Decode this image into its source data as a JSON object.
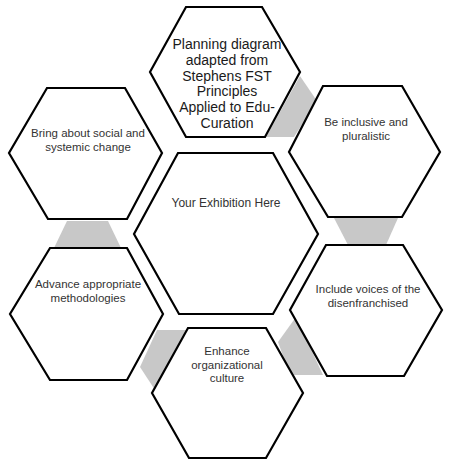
{
  "diagram": {
    "type": "hexagon-cycle",
    "colors": {
      "stroke": "#000000",
      "fill": "#ffffff",
      "connector": "#c8c8c8",
      "text": "#333333"
    },
    "center": {
      "label": "Your Exhibition Here"
    },
    "nodes": [
      {
        "id": "top",
        "label": "Planning diagram adapted from Stephens FST Principles Applied to Edu-Curation"
      },
      {
        "id": "right-top",
        "label": "Be inclusive and pluralistic"
      },
      {
        "id": "right-bottom",
        "label": "Include voices of the disenfranchised"
      },
      {
        "id": "bottom",
        "label": "Enhance organizational culture"
      },
      {
        "id": "left-bottom",
        "label": "Advance appropriate methodologies"
      },
      {
        "id": "left-top",
        "label": "Bring about social and systemic change"
      }
    ]
  }
}
